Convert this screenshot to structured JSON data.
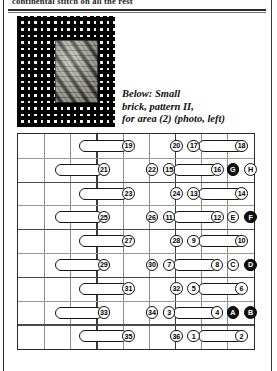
{
  "page": {
    "headline": "continental stitch on all the rest",
    "caption_lines": [
      "Below: Small",
      "brick, pattern II,",
      "for area (2) (photo, left)"
    ],
    "photo": {
      "alt": "needlepoint-canvas-with-small-brick-pattern-swatch"
    }
  },
  "chart_data": {
    "type": "diagram",
    "columns": 9,
    "rows": 9,
    "grid": true,
    "rows_data": [
      {
        "index": 1,
        "capsule": {
          "start_col": 3.35,
          "span_cols": 1.85
        },
        "marks": [
          {
            "label": "19",
            "col": 5.22,
            "style": "light"
          },
          {
            "label": "20",
            "col": 7.05,
            "style": "light"
          },
          {
            "label": "17",
            "col": 7.72,
            "style": "light"
          },
          {
            "label": "18",
            "col": 9.55,
            "style": "light"
          }
        ],
        "capsule2": {
          "start_col": 7.9,
          "span_cols": 1.7
        }
      },
      {
        "index": 2,
        "capsule": {
          "start_col": 2.4,
          "span_cols": 1.85
        },
        "marks": [
          {
            "label": "21",
            "col": 4.28,
            "style": "light"
          },
          {
            "label": "22",
            "col": 6.12,
            "style": "light"
          },
          {
            "label": "15",
            "col": 6.78,
            "style": "light"
          },
          {
            "label": "16",
            "col": 8.62,
            "style": "light"
          },
          {
            "label": "G",
            "col": 9.22,
            "style": "dark"
          },
          {
            "label": "H",
            "col": 9.9,
            "style": "light"
          }
        ],
        "capsule2": {
          "start_col": 6.95,
          "span_cols": 1.7
        }
      },
      {
        "index": 3,
        "capsule": {
          "start_col": 3.35,
          "span_cols": 1.85
        },
        "marks": [
          {
            "label": "23",
            "col": 5.22,
            "style": "light"
          },
          {
            "label": "24",
            "col": 7.05,
            "style": "light"
          },
          {
            "label": "13",
            "col": 7.72,
            "style": "light"
          },
          {
            "label": "14",
            "col": 9.55,
            "style": "light"
          }
        ],
        "capsule2": {
          "start_col": 7.9,
          "span_cols": 1.7
        }
      },
      {
        "index": 4,
        "capsule": {
          "start_col": 2.4,
          "span_cols": 1.85
        },
        "marks": [
          {
            "label": "25",
            "col": 4.28,
            "style": "light"
          },
          {
            "label": "26",
            "col": 6.12,
            "style": "light"
          },
          {
            "label": "11",
            "col": 6.78,
            "style": "light"
          },
          {
            "label": "12",
            "col": 8.62,
            "style": "light"
          },
          {
            "label": "E",
            "col": 9.22,
            "style": "light"
          },
          {
            "label": "F",
            "col": 9.9,
            "style": "dark"
          }
        ],
        "capsule2": {
          "start_col": 6.95,
          "span_cols": 1.7
        }
      },
      {
        "index": 5,
        "capsule": {
          "start_col": 3.35,
          "span_cols": 1.85
        },
        "marks": [
          {
            "label": "27",
            "col": 5.22,
            "style": "light"
          },
          {
            "label": "28",
            "col": 7.05,
            "style": "light"
          },
          {
            "label": "9",
            "col": 7.72,
            "style": "light"
          },
          {
            "label": "10",
            "col": 9.55,
            "style": "light"
          }
        ],
        "capsule2": {
          "start_col": 7.9,
          "span_cols": 1.7
        }
      },
      {
        "index": 6,
        "capsule": {
          "start_col": 2.4,
          "span_cols": 1.85
        },
        "marks": [
          {
            "label": "29",
            "col": 4.28,
            "style": "light"
          },
          {
            "label": "30",
            "col": 6.12,
            "style": "light"
          },
          {
            "label": "7",
            "col": 6.78,
            "style": "light"
          },
          {
            "label": "8",
            "col": 8.62,
            "style": "light"
          },
          {
            "label": "C",
            "col": 9.22,
            "style": "light"
          },
          {
            "label": "D",
            "col": 9.9,
            "style": "dark"
          }
        ],
        "capsule2": {
          "start_col": 6.95,
          "span_cols": 1.7
        }
      },
      {
        "index": 7,
        "capsule": {
          "start_col": 3.35,
          "span_cols": 1.85
        },
        "marks": [
          {
            "label": "31",
            "col": 5.22,
            "style": "light"
          },
          {
            "label": "32",
            "col": 7.05,
            "style": "light"
          },
          {
            "label": "5",
            "col": 7.72,
            "style": "light"
          },
          {
            "label": "6",
            "col": 9.55,
            "style": "light"
          }
        ],
        "capsule2": {
          "start_col": 7.9,
          "span_cols": 1.7
        }
      },
      {
        "index": 8,
        "capsule": {
          "start_col": 2.4,
          "span_cols": 1.85
        },
        "marks": [
          {
            "label": "33",
            "col": 4.28,
            "style": "light"
          },
          {
            "label": "34",
            "col": 6.12,
            "style": "light"
          },
          {
            "label": "3",
            "col": 6.78,
            "style": "light"
          },
          {
            "label": "4",
            "col": 8.62,
            "style": "light"
          },
          {
            "label": "A",
            "col": 9.22,
            "style": "dark"
          },
          {
            "label": "B",
            "col": 9.9,
            "style": "dark"
          }
        ],
        "capsule2": {
          "start_col": 6.95,
          "span_cols": 1.7
        }
      },
      {
        "index": 9,
        "capsule": {
          "start_col": 3.35,
          "span_cols": 1.85
        },
        "marks": [
          {
            "label": "35",
            "col": 5.22,
            "style": "light"
          },
          {
            "label": "36",
            "col": 7.05,
            "style": "light"
          },
          {
            "label": "1",
            "col": 7.72,
            "style": "light"
          },
          {
            "label": "2",
            "col": 9.55,
            "style": "light"
          }
        ],
        "capsule2": {
          "start_col": 7.9,
          "span_cols": 1.7
        }
      }
    ]
  }
}
